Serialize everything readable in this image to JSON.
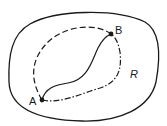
{
  "diagram": {
    "type": "region-with-paths",
    "region": {
      "label": "R",
      "boundary": "closed-curve"
    },
    "points": [
      {
        "id": "A",
        "label": "A",
        "x": 42,
        "y": 100
      },
      {
        "id": "B",
        "label": "B",
        "x": 111,
        "y": 34
      }
    ],
    "paths": [
      {
        "id": "path-upper",
        "from": "A",
        "to": "B",
        "style": "dashed"
      },
      {
        "id": "path-middle",
        "from": "A",
        "to": "B",
        "style": "solid"
      },
      {
        "id": "path-lower",
        "from": "A",
        "to": "B",
        "style": "dash-dot"
      }
    ],
    "colors": {
      "stroke": "#1a1a1a",
      "background": "#ffffff"
    }
  }
}
